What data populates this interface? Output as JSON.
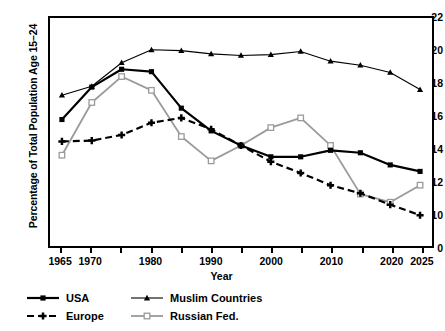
{
  "chart_data": {
    "type": "line",
    "title": "",
    "xlabel": "Year",
    "ylabel": "Percentage of Total Population Age 15–24",
    "x": [
      1965,
      1970,
      1975,
      1980,
      1985,
      1990,
      1995,
      2000,
      2005,
      2010,
      2015,
      2020,
      2025
    ],
    "xtick_labels": [
      "1965",
      "1970",
      "1980",
      "1990",
      "2000",
      "2010",
      "2020",
      "2025"
    ],
    "xtick_values": [
      1965,
      1970,
      1980,
      1990,
      2000,
      2010,
      2020,
      2025
    ],
    "xlim": [
      1963,
      2027
    ],
    "ytick_labels": [
      "0",
      "10",
      "12",
      "14",
      "16",
      "18",
      "20",
      "22"
    ],
    "ytick_values": [
      0,
      10,
      12,
      14,
      16,
      18,
      20,
      22
    ],
    "ylim": [
      10,
      22
    ],
    "y_axis_break": true,
    "grid": false,
    "legend_position": "below-left",
    "series": [
      {
        "name": "USA",
        "color": "#000000",
        "marker": "square-filled",
        "line_style": "solid",
        "line_width": 2.2,
        "values": [
          15.8,
          17.8,
          18.9,
          18.75,
          16.5,
          15.1,
          14.2,
          13.5,
          13.5,
          13.9,
          13.75,
          13.0,
          12.6
        ]
      },
      {
        "name": "Europe",
        "color": "#000000",
        "marker": "plus-filled",
        "line_style": "dashed",
        "line_width": 2.2,
        "values": [
          14.45,
          14.5,
          14.85,
          15.6,
          15.9,
          15.2,
          14.2,
          13.2,
          12.5,
          11.75,
          11.25,
          10.55,
          9.9
        ]
      },
      {
        "name": "Muslim Countries",
        "color": "#000000",
        "marker": "triangle-filled",
        "line_style": "solid",
        "line_width": 1.1,
        "values": [
          17.3,
          17.85,
          19.3,
          20.1,
          20.05,
          19.85,
          19.75,
          19.8,
          20.0,
          19.4,
          19.15,
          18.7,
          17.65
        ]
      },
      {
        "name": "Russian Fed.",
        "color": "#9a9a9a",
        "marker": "square-open",
        "line_style": "solid",
        "line_width": 1.8,
        "values": [
          13.6,
          16.85,
          18.45,
          17.6,
          14.75,
          13.25,
          14.2,
          15.3,
          15.9,
          14.2,
          11.2,
          10.7,
          11.75
        ]
      }
    ]
  },
  "legend": {
    "items": [
      {
        "label": "USA",
        "key": "usa"
      },
      {
        "label": "Europe",
        "key": "europe"
      },
      {
        "label": "Muslim Countries",
        "key": "muslim-countries"
      },
      {
        "label": "Russian Fed.",
        "key": "russian-fed"
      }
    ]
  }
}
